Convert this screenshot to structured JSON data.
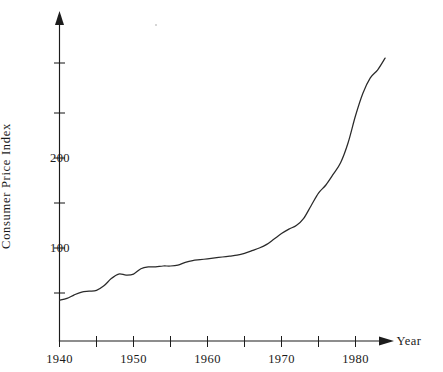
{
  "chart_data": {
    "type": "line",
    "title": "",
    "xlabel": "Year",
    "ylabel": "Consumer Price Index",
    "xlim": [
      1940,
      1986
    ],
    "ylim": [
      30,
      325
    ],
    "grid": false,
    "legend": null,
    "x_ticks_major": [
      1940,
      1950,
      1960,
      1970,
      1980
    ],
    "x_tick_labels": [
      "1940",
      "1950",
      "1960",
      "1970",
      "1980"
    ],
    "x_ticks_all": [
      1940,
      1945,
      1950,
      1955,
      1960,
      1965,
      1970,
      1975,
      1980
    ],
    "y_ticks_all": [
      50,
      100,
      150,
      200,
      250,
      300
    ],
    "y_ticks_labeled": [
      100,
      200
    ],
    "y_tick_labels": [
      "100",
      "200"
    ],
    "axis_style": "arrow-terminated L-shaped axes, open right and top",
    "series": [
      {
        "name": "Consumer Price Index",
        "x": [
          1940,
          1941,
          1942,
          1943,
          1944,
          1945,
          1946,
          1947,
          1948,
          1949,
          1950,
          1951,
          1952,
          1953,
          1954,
          1955,
          1956,
          1957,
          1958,
          1959,
          1960,
          1961,
          1962,
          1963,
          1964,
          1965,
          1966,
          1967,
          1968,
          1969,
          1970,
          1971,
          1972,
          1973,
          1974,
          1975,
          1976,
          1977,
          1978,
          1979,
          1980,
          1981,
          1982,
          1983,
          1984
        ],
        "values": [
          42,
          44,
          48,
          51,
          52,
          53,
          58,
          66,
          71,
          70,
          71,
          77,
          79,
          79,
          80,
          80,
          81,
          84,
          86,
          87,
          88,
          89,
          90,
          91,
          92,
          94,
          97,
          100,
          104,
          110,
          116,
          121,
          125,
          133,
          147,
          161,
          170,
          182,
          195,
          217,
          247,
          272,
          289,
          298,
          311
        ]
      }
    ],
    "annotations": [
      {
        "text": "plateau in early 1950s",
        "x_range": [
          1948,
          1955
        ]
      },
      {
        "text": "steep acceleration after 1973",
        "x_range": [
          1973,
          1981
        ]
      }
    ]
  },
  "axis_labels": {
    "y_axis_title": "Consumer Price Index",
    "x_axis_title": "Year"
  },
  "colors": {
    "curve": "#2a2a2a",
    "axis": "#1c1c1c",
    "background": "#ffffff",
    "text": "#1a1a1a"
  }
}
